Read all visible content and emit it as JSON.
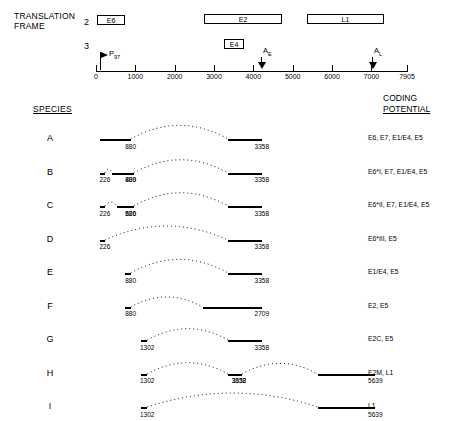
{
  "header": {
    "translation_frame": "TRANSLATION\nFRAME",
    "frame_rows": [
      "2",
      "3"
    ],
    "species_heading": "SPECIES",
    "coding_heading_line1": "CODING",
    "coding_heading_line2": "POTENTIAL"
  },
  "orfs": [
    {
      "name": "E6",
      "frame": 2
    },
    {
      "name": "E2",
      "frame": 2
    },
    {
      "name": "L1",
      "frame": 2
    },
    {
      "name": "E4",
      "frame": 3
    }
  ],
  "ruler": {
    "start": 0,
    "end": 7905,
    "tick_labels": [
      "0",
      "1000",
      "2000",
      "3000",
      "4000",
      "5000",
      "6000",
      "7000",
      "7905"
    ],
    "tick_values": [
      0,
      1000,
      2000,
      3000,
      4000,
      5000,
      6000,
      7000,
      7905
    ]
  },
  "promoter": {
    "label": "P",
    "subscript": "97",
    "position": 97
  },
  "polya_sites": [
    {
      "label": "A",
      "subscript": "E",
      "position": 4215
    },
    {
      "label": "A",
      "subscript": "L",
      "position": 7100
    }
  ],
  "species": [
    {
      "letter": "A",
      "exons": [
        {
          "start": 97,
          "end": 880,
          "label": "880"
        },
        {
          "start": 3358,
          "end": 4215,
          "label": "3358"
        }
      ],
      "coding_potential": "E6, E7, E1/E4, E5"
    },
    {
      "letter": "B",
      "exons": [
        {
          "start": 97,
          "end": 226,
          "label": "226"
        },
        {
          "start": 409,
          "end": 880,
          "label": "409"
        },
        {
          "start": 880,
          "end": 880,
          "label": "880"
        },
        {
          "start": 3358,
          "end": 4215,
          "label": "3358"
        }
      ],
      "coding_potential": "E6*I, E7, E1/E4, E5"
    },
    {
      "letter": "C",
      "exons": [
        {
          "start": 97,
          "end": 226,
          "label": "226"
        },
        {
          "start": 526,
          "end": 880,
          "label": "526"
        },
        {
          "start": 880,
          "end": 880,
          "label": "880"
        },
        {
          "start": 3358,
          "end": 4215,
          "label": "3358"
        }
      ],
      "coding_potential": "E6*II, E7, E1/E4, E5"
    },
    {
      "letter": "D",
      "exons": [
        {
          "start": 97,
          "end": 226,
          "label": "226"
        },
        {
          "start": 3358,
          "end": 4215,
          "label": "3358"
        }
      ],
      "coding_potential": "E6*III, E5"
    },
    {
      "letter": "E",
      "exons": [
        {
          "start": 742,
          "end": 880,
          "label": "880"
        },
        {
          "start": 3358,
          "end": 4215,
          "label": "3358"
        }
      ],
      "coding_potential": "E1/E4, E5"
    },
    {
      "letter": "F",
      "exons": [
        {
          "start": 742,
          "end": 880,
          "label": "880"
        },
        {
          "start": 2709,
          "end": 4215,
          "label": "2709"
        }
      ],
      "coding_potential": "E2, E5"
    },
    {
      "letter": "G",
      "exons": [
        {
          "start": 1145,
          "end": 1302,
          "label": "1302"
        },
        {
          "start": 3358,
          "end": 4215,
          "label": "3358"
        }
      ],
      "coding_potential": "E2C, E5"
    },
    {
      "letter": "H",
      "exons": [
        {
          "start": 1145,
          "end": 1302,
          "label": "1302"
        },
        {
          "start": 3358,
          "end": 3632,
          "label": "3358"
        },
        {
          "start": 3632,
          "end": 3632,
          "label": "3632"
        },
        {
          "start": 5639,
          "end": 7100,
          "label": "5639"
        }
      ],
      "coding_potential": "E2M, L1"
    },
    {
      "letter": "I",
      "exons": [
        {
          "start": 1145,
          "end": 1302,
          "label": "1302"
        },
        {
          "start": 5639,
          "end": 7100,
          "label": "5639"
        }
      ],
      "coding_potential": "L1"
    }
  ],
  "colors": {
    "line": "#000000",
    "background": "#ffffff"
  }
}
